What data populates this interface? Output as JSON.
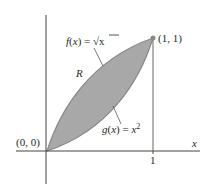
{
  "diagram": {
    "region_label": "R",
    "f_label": {
      "name": "f",
      "arg": "x",
      "eq": "=",
      "expr": "√x"
    },
    "g_label": {
      "name": "g",
      "arg": "x",
      "eq": "=",
      "expr": "x",
      "exp": "2"
    },
    "origin_label": "(0, 0)",
    "point_label": "(1, 1)",
    "x_axis_label": "x",
    "x_tick_label": "1",
    "colors": {
      "fill": "#a8a8a8",
      "curve": "#8a8a8a",
      "axis": "#444444",
      "point": "#888888"
    }
  }
}
